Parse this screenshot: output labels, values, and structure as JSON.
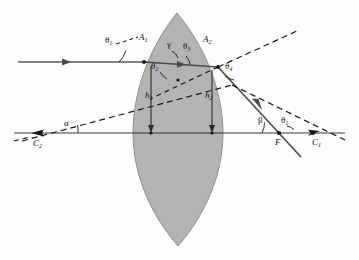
{
  "figure": {
    "type": "optics-ray-diagram",
    "colors": {
      "lens_fill": "#b3b3b3",
      "lens_stroke": "#8a8a8a",
      "ray_solid": "#4a4a4a",
      "ray_dashed": "#1a1a1a",
      "axis": "#3a3a3a",
      "label": "#101010",
      "background": "#fefefe"
    },
    "labels": [
      {
        "id": "theta1-incident",
        "text": "θ",
        "sub": "1",
        "x": 107,
        "y": 39,
        "kind": "greek"
      },
      {
        "id": "A1",
        "text": "A",
        "sub": "1",
        "x": 141,
        "y": 37,
        "kind": "upright"
      },
      {
        "id": "gamma",
        "text": "γ",
        "sub": "",
        "x": 168,
        "y": 42,
        "kind": "greek"
      },
      {
        "id": "theta3",
        "text": "θ",
        "sub": "3",
        "x": 185,
        "y": 44,
        "kind": "greek"
      },
      {
        "id": "A2",
        "text": "A",
        "sub": "2",
        "x": 204,
        "y": 39,
        "kind": "upright"
      },
      {
        "id": "theta2",
        "text": "θ",
        "sub": "2",
        "x": 153,
        "y": 64,
        "kind": "greek"
      },
      {
        "id": "theta4",
        "text": "θ",
        "sub": "4",
        "x": 226,
        "y": 64,
        "kind": "greek"
      },
      {
        "id": "h1",
        "text": "h",
        "sub": "1",
        "x": 147,
        "y": 95,
        "kind": "upright"
      },
      {
        "id": "h2",
        "text": "h",
        "sub": "2",
        "x": 206,
        "y": 95,
        "kind": "upright"
      },
      {
        "id": "alpha",
        "text": "α",
        "sub": "",
        "x": 65,
        "y": 122,
        "kind": "greek"
      },
      {
        "id": "C2",
        "text": "C",
        "sub": "2",
        "x": 35,
        "y": 142,
        "kind": "upright"
      },
      {
        "id": "beta",
        "text": "β",
        "sub": "",
        "x": 259,
        "y": 118,
        "kind": "greek"
      },
      {
        "id": "theta1-exit",
        "text": "θ",
        "sub": "1",
        "x": 283,
        "y": 119,
        "kind": "greek"
      },
      {
        "id": "F",
        "text": "F",
        "sub": "",
        "x": 276,
        "y": 142,
        "kind": "upright"
      },
      {
        "id": "C1",
        "text": "C",
        "sub": "1",
        "x": 314,
        "y": 142,
        "kind": "upright"
      }
    ],
    "points": [
      {
        "id": "A1",
        "x": 144,
        "y": 62
      },
      {
        "id": "A2",
        "x": 218,
        "y": 67
      },
      {
        "id": "F",
        "x": 279,
        "y": 133
      },
      {
        "id": "C1",
        "x": 313,
        "y": 133
      },
      {
        "id": "C2",
        "x": 38,
        "y": 133
      },
      {
        "id": "h1-foot",
        "x": 151,
        "y": 133
      },
      {
        "id": "h2-foot",
        "x": 212,
        "y": 133
      },
      {
        "id": "lens-center",
        "x": 178,
        "y": 80
      }
    ],
    "geometry": {
      "optical_axis_y": 133,
      "incident_ray_y": 62,
      "lens_apex_top": {
        "x": 177,
        "y": 13
      },
      "lens_apex_bottom": {
        "x": 178,
        "y": 246
      },
      "lens_left_edge_x": 133,
      "lens_right_edge_x": 223
    }
  }
}
